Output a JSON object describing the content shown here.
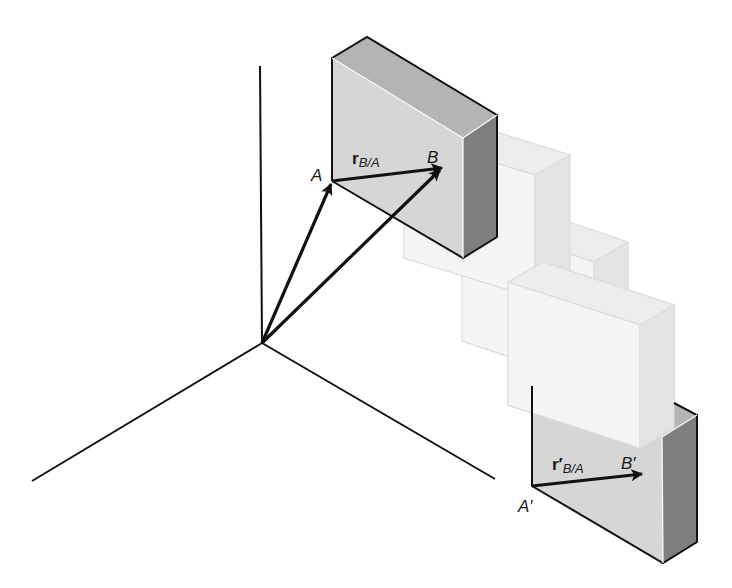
{
  "figure": {
    "colors": {
      "front_face": "#d6d6d6",
      "top_face": "#b4b4b4",
      "side_face": "#7e7e7e",
      "ghost_front": "#f4f4f4",
      "ghost_top": "#ececec",
      "ghost_side": "#e2e2e2",
      "ghost_edge": "#dcdcdc",
      "ink": "#111111"
    },
    "labels": {
      "point_a": "A",
      "point_b": "B",
      "vector_initial_main": "r",
      "vector_initial_sub": "B/A",
      "point_a_prime": "A′",
      "point_b_prime": "B′",
      "vector_final_main": "r′",
      "vector_final_sub": "B/A"
    },
    "axes": {
      "origin": [
        262,
        343
      ],
      "vertical_end": [
        260,
        66
      ],
      "left_end": [
        32,
        481
      ],
      "right_end": [
        495,
        479
      ]
    },
    "position_vectors": [
      {
        "name": "r_A",
        "from": [
          262,
          343
        ],
        "to": [
          332,
          181
        ]
      },
      {
        "name": "r_B",
        "from": [
          262,
          343
        ],
        "to": [
          442,
          168
        ]
      }
    ],
    "blocks": [
      {
        "state": "initial",
        "ghost": false
      },
      {
        "state": "intermediate-1",
        "ghost": true
      },
      {
        "state": "intermediate-2",
        "ghost": true
      },
      {
        "state": "intermediate-3",
        "ghost": true
      },
      {
        "state": "final",
        "ghost": false
      }
    ]
  }
}
